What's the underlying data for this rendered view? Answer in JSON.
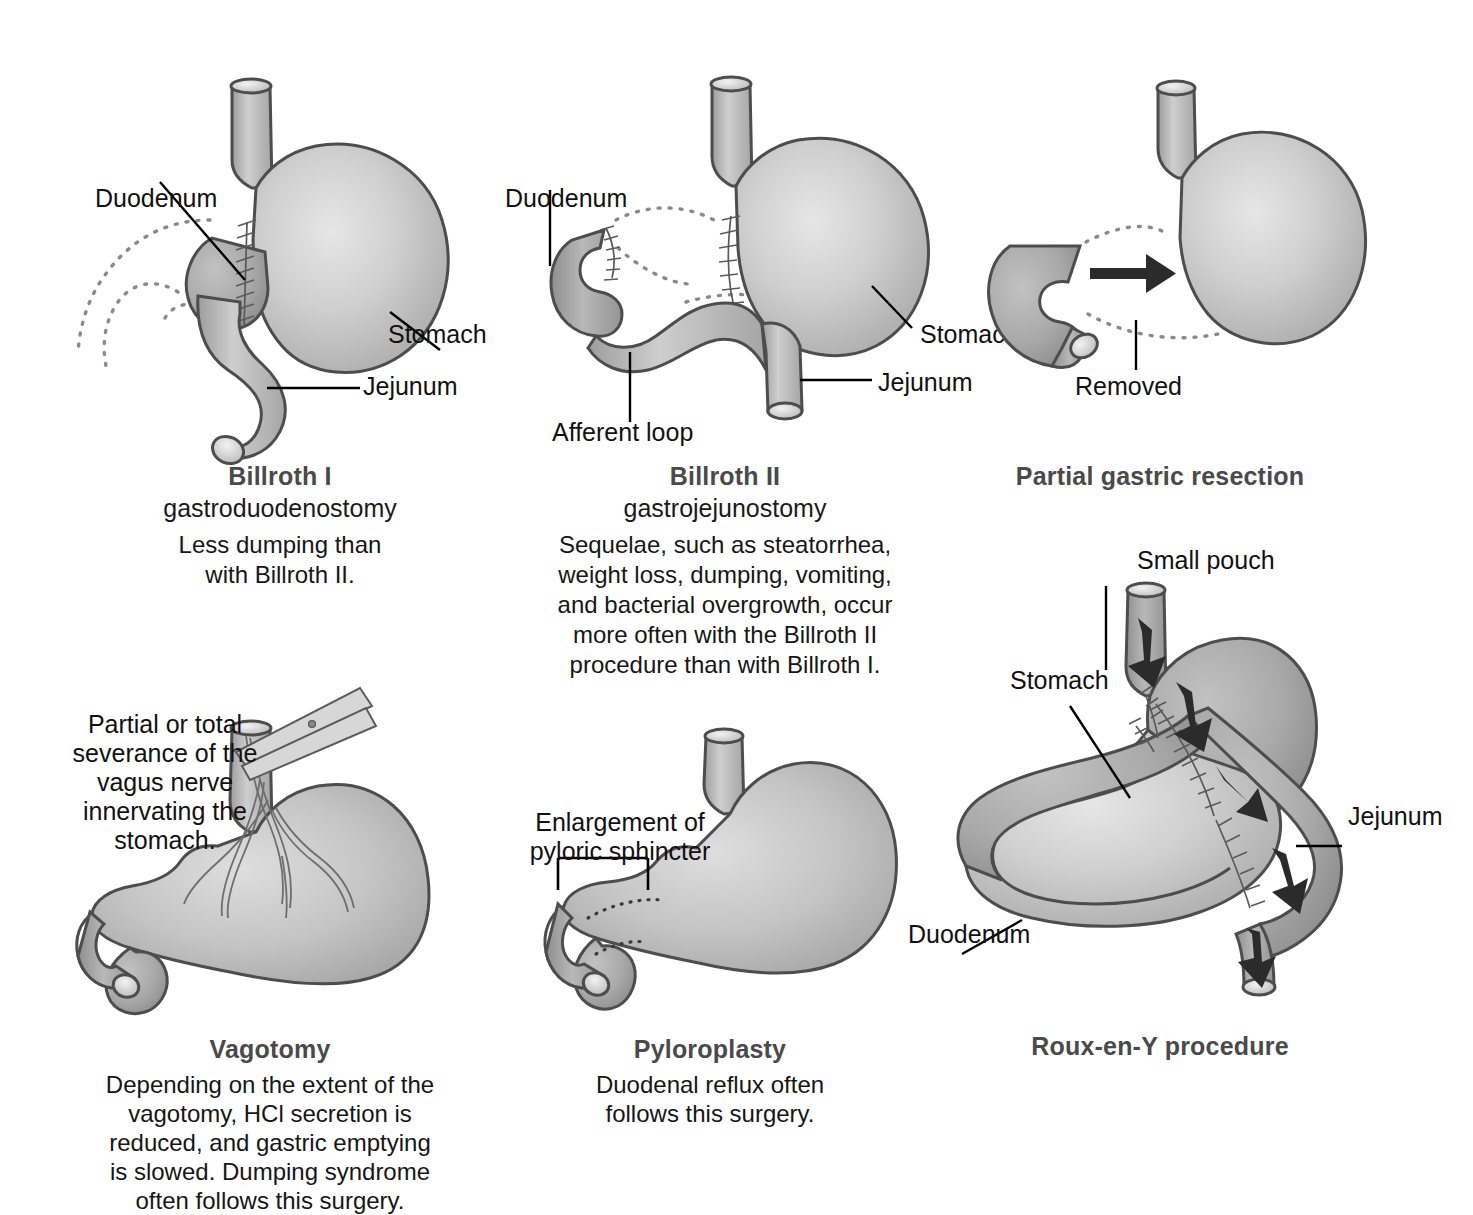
{
  "figure": {
    "kind": "medical-illustration",
    "palette": {
      "organ_light": "#d2d2d2",
      "organ_mid": "#b6b6b6",
      "organ_dark": "#a0a0a0",
      "outline": "#4d4d4d",
      "caption_heading": "#4a4a4a",
      "caption_body": "#161616",
      "background": "#ffffff"
    }
  },
  "panels": [
    {
      "id": "billroth-1",
      "title": "Billroth I",
      "subtitle": "gastroduodenostomy",
      "body": "Less dumping than\nwith Billroth II.",
      "body_lines": [
        "Less dumping than",
        "with Billroth II."
      ],
      "labels": [
        {
          "name": "duodenum",
          "text": "Duodenum"
        },
        {
          "name": "stomach",
          "text": "Stomach"
        },
        {
          "name": "jejunum",
          "text": "Jejunum"
        }
      ]
    },
    {
      "id": "billroth-2",
      "title": "Billroth II",
      "subtitle": "gastrojejunostomy",
      "body_lines": [
        "Sequelae, such as steatorrhea,",
        "weight loss, dumping, vomiting,",
        "and bacterial overgrowth, occur",
        "more often with the Billroth II",
        "procedure than with Billroth I."
      ],
      "labels": [
        {
          "name": "duodenum",
          "text": "Duodenum"
        },
        {
          "name": "stomach",
          "text": "Stomach"
        },
        {
          "name": "jejunum",
          "text": "Jejunum"
        },
        {
          "name": "afferent-loop",
          "text": "Afferent loop"
        }
      ]
    },
    {
      "id": "partial-gastric-resection",
      "title": "Partial gastric resection",
      "subtitle": "",
      "body_lines": [],
      "labels": [
        {
          "name": "removed",
          "text": "Removed"
        }
      ]
    },
    {
      "id": "vagotomy",
      "title": "Vagotomy",
      "subtitle": "",
      "annotation_lines": [
        "Partial or total",
        "severance of the",
        "vagus nerve",
        "innervating the",
        "stomach."
      ],
      "body_lines": [
        "Depending on the extent of the",
        "vagotomy, HCl secretion is",
        "reduced, and gastric emptying",
        "is slowed. Dumping syndrome",
        "often follows this surgery."
      ],
      "labels": []
    },
    {
      "id": "pyloroplasty",
      "title": "Pyloroplasty",
      "subtitle": "",
      "body_lines": [
        "Duodenal reflux often",
        "follows this surgery."
      ],
      "annotation_lines": [
        "Enlargement of",
        "pyloric sphincter"
      ],
      "labels": []
    },
    {
      "id": "roux-en-y",
      "title": "Roux-en-Y procedure",
      "subtitle": "",
      "body_lines": [],
      "labels": [
        {
          "name": "small-pouch",
          "text": "Small pouch"
        },
        {
          "name": "stomach",
          "text": "Stomach"
        },
        {
          "name": "jejunum",
          "text": "Jejunum"
        },
        {
          "name": "duodenum",
          "text": "Duodenum"
        }
      ]
    }
  ],
  "text": {
    "b1_title": "Billroth I",
    "b1_sub": "gastroduodenostomy",
    "b1_body1": "Less dumping than",
    "b1_body2": "with Billroth II.",
    "b1_duodenum": "Duodenum",
    "b1_stomach": "Stomach",
    "b1_jejunum": "Jejunum",
    "b2_title": "Billroth II",
    "b2_sub": "gastrojejunostomy",
    "b2_body1": "Sequelae, such as steatorrhea,",
    "b2_body2": "weight loss, dumping, vomiting,",
    "b2_body3": "and bacterial overgrowth, occur",
    "b2_body4": "more often with the Billroth II",
    "b2_body5": "procedure than with Billroth I.",
    "b2_duodenum": "Duodenum",
    "b2_stomach": "Stomach",
    "b2_jejunum": "Jejunum",
    "b2_afferent": "Afferent loop",
    "pgr_title": "Partial gastric resection",
    "pgr_removed": "Removed",
    "vag_title": "Vagotomy",
    "vag_note1": "Partial or total",
    "vag_note2": "severance of the",
    "vag_note3": "vagus nerve",
    "vag_note4": "innervating the",
    "vag_note5": "stomach.",
    "vag_body1": "Depending on the extent of the",
    "vag_body2": "vagotomy, HCl secretion is",
    "vag_body3": "reduced, and gastric emptying",
    "vag_body4": "is slowed. Dumping syndrome",
    "vag_body5": "often follows this surgery.",
    "pyl_title": "Pyloroplasty",
    "pyl_note1": "Enlargement of",
    "pyl_note2": "pyloric sphincter",
    "pyl_body1": "Duodenal reflux often",
    "pyl_body2": "follows this surgery.",
    "rxy_title": "Roux-en-Y procedure",
    "rxy_small_pouch": "Small pouch",
    "rxy_stomach": "Stomach",
    "rxy_jejunum": "Jejunum",
    "rxy_duodenum": "Duodenum"
  }
}
